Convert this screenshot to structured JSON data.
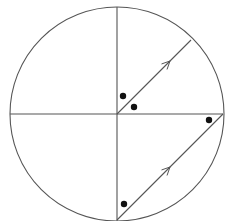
{
  "diagram": {
    "type": "geometry",
    "colors": {
      "stroke": "#555555",
      "dot": "#111111",
      "background": "#ffffff"
    },
    "circle": {
      "cx": 117,
      "cy": 114,
      "r": 107
    },
    "lines": [
      {
        "name": "horizontal-diameter",
        "x1": 10,
        "y1": 114,
        "x2": 223,
        "y2": 114
      },
      {
        "name": "vertical-diameter",
        "x1": 117,
        "y1": 7,
        "x2": 117,
        "y2": 221
      },
      {
        "name": "upper-radius",
        "x1": 117,
        "y1": 114,
        "x2": 191,
        "y2": 40
      },
      {
        "name": "lower-chord",
        "x1": 117,
        "y1": 220,
        "x2": 223,
        "y2": 114
      }
    ],
    "arrows": [
      {
        "name": "upper-arrow",
        "tipX": 170,
        "tipY": 61
      },
      {
        "name": "lower-arrow",
        "tipX": 170,
        "tipY": 167
      }
    ],
    "dots": [
      {
        "name": "dot-near-center-upper",
        "cx": 123,
        "cy": 96
      },
      {
        "name": "dot-near-center-right",
        "cx": 134,
        "cy": 107
      },
      {
        "name": "dot-right-end",
        "cx": 209,
        "cy": 120
      },
      {
        "name": "dot-bottom",
        "cx": 124,
        "cy": 204
      }
    ]
  }
}
